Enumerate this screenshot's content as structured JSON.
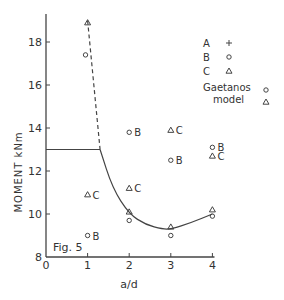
{
  "chart_data": {
    "type": "scatter",
    "title": "Fig. 5",
    "xlabel": "a/d",
    "ylabel": "MOMENT kNm",
    "xlim": [
      0,
      4
    ],
    "ylim": [
      8,
      19
    ],
    "x_ticks": [
      "0",
      "1",
      "2",
      "3",
      "4"
    ],
    "y_ticks": [
      "8",
      "10",
      "12",
      "14",
      "16",
      "18"
    ],
    "grid": false,
    "legend": {
      "position": "upper right",
      "entries": [
        {
          "label": "A",
          "marker": "+"
        },
        {
          "label": "B",
          "marker": "o"
        },
        {
          "label": "C",
          "marker": "triangle"
        }
      ],
      "model_label_1": "Gaetanos",
      "model_label_2": "model",
      "model_markers": [
        "o",
        "triangle"
      ]
    },
    "series": [
      {
        "name": "A",
        "marker": "+",
        "points": []
      },
      {
        "name": "B",
        "marker": "o",
        "points": [
          {
            "x": 1.0,
            "y": 9.0,
            "label": "B"
          },
          {
            "x": 2.0,
            "y": 13.8,
            "label": "B"
          },
          {
            "x": 3.0,
            "y": 12.5,
            "label": "B"
          },
          {
            "x": 4.0,
            "y": 13.1,
            "label": "B"
          }
        ]
      },
      {
        "name": "C",
        "marker": "triangle",
        "points": [
          {
            "x": 1.0,
            "y": 10.9,
            "label": "C"
          },
          {
            "x": 2.0,
            "y": 11.2,
            "label": "C"
          },
          {
            "x": 3.0,
            "y": 13.9,
            "label": "C"
          },
          {
            "x": 4.0,
            "y": 12.7,
            "label": "C"
          }
        ]
      },
      {
        "name": "Gaetanos model (B)",
        "marker": "o",
        "points": [
          {
            "x": 0.95,
            "y": 17.4
          },
          {
            "x": 2.0,
            "y": 9.7
          },
          {
            "x": 3.0,
            "y": 9.0
          },
          {
            "x": 4.0,
            "y": 9.9
          }
        ]
      },
      {
        "name": "Gaetanos model (C)",
        "marker": "triangle",
        "points": [
          {
            "x": 1.0,
            "y": 18.9
          },
          {
            "x": 2.0,
            "y": 10.1
          },
          {
            "x": 3.0,
            "y": 9.4
          },
          {
            "x": 4.0,
            "y": 10.2
          }
        ]
      }
    ],
    "lines": [
      {
        "name": "plateau",
        "style": "solid",
        "x": [
          0,
          1.3
        ],
        "y": [
          13,
          13
        ]
      },
      {
        "name": "dashed branch",
        "style": "dashed",
        "x": [
          1.0,
          1.3
        ],
        "y": [
          19.0,
          13.0
        ]
      },
      {
        "name": "curve",
        "style": "solid",
        "x": [
          1.3,
          1.6,
          2.0,
          2.4,
          2.8,
          3.0,
          3.5,
          4.0
        ],
        "y": [
          13.0,
          11.2,
          10.0,
          9.5,
          9.3,
          9.3,
          9.6,
          10.0
        ]
      },
      {
        "name": "point A top label",
        "x": [
          1.0
        ],
        "y": [
          18.9
        ]
      }
    ]
  }
}
